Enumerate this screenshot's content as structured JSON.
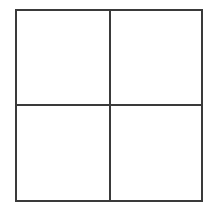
{
  "grid": {
    "rows": 2,
    "columns": 2,
    "line_color": "#3a3a3a",
    "background": "#ffffff",
    "cells": [
      {
        "row": 0,
        "col": 0,
        "content": ""
      },
      {
        "row": 0,
        "col": 1,
        "content": ""
      },
      {
        "row": 1,
        "col": 0,
        "content": ""
      },
      {
        "row": 1,
        "col": 1,
        "content": ""
      }
    ]
  }
}
